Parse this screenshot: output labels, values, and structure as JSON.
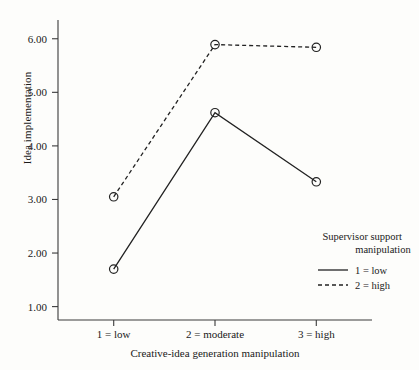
{
  "chart_data": {
    "type": "line",
    "title": "",
    "xlabel": "Creative-idea generation manipulation",
    "ylabel": "Idea implementation",
    "categories": [
      "1 = low",
      "2 = moderate",
      "3 = high"
    ],
    "xtick_values": [
      1,
      2,
      3
    ],
    "ytick_labels": [
      "1.00",
      "2.00",
      "3.00",
      "4.00",
      "5.00",
      "6.00"
    ],
    "ytick_values": [
      1.0,
      2.0,
      3.0,
      4.0,
      5.0,
      6.0
    ],
    "ylim": [
      0.75,
      6.35
    ],
    "xlim": [
      0.45,
      3.55
    ],
    "grid": false,
    "legend_position": "inside-bottom-right",
    "legend_title_line1": "Supervisor support",
    "legend_title_line2": "manipulation",
    "series": [
      {
        "name": "1 = low",
        "line_style": "solid",
        "marker": "open-circle",
        "color": "#222222",
        "values": [
          1.7,
          4.62,
          3.33
        ]
      },
      {
        "name": "2 = high",
        "line_style": "dashed",
        "marker": "open-circle",
        "color": "#222222",
        "values": [
          3.05,
          5.89,
          5.84
        ]
      }
    ]
  },
  "figure": {
    "background": "#fdfdfb",
    "axis_color": "#3a3a3a",
    "text_color": "#1a1a1a"
  }
}
